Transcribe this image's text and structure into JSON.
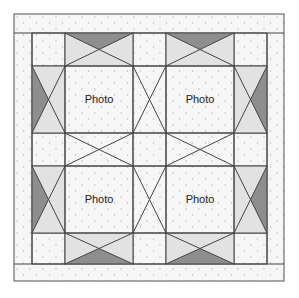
{
  "quilt": {
    "colors": {
      "background": "#ffffff",
      "border_fill": "#f6f6f6",
      "border_dot": "#b8b8b8",
      "corner_fill": "#ececec",
      "corner_squiggle": "#d2d2d2",
      "light_triangle": "#e2e2e2",
      "dark_triangle": "#8e8e8e",
      "photo_fill": "#ffffff",
      "outline": "#444444"
    },
    "photos": [
      {
        "label": "Photo",
        "position": "top-left"
      },
      {
        "label": "Photo",
        "position": "top-right"
      },
      {
        "label": "Photo",
        "position": "bottom-left"
      },
      {
        "label": "Photo",
        "position": "bottom-right"
      }
    ],
    "grid": {
      "outer": {
        "x0": 14,
        "y0": 14,
        "x1": 284,
        "y1": 281
      },
      "cols": [
        32,
        65,
        133,
        166,
        234,
        267
      ],
      "rows": [
        33,
        66,
        133,
        166,
        233,
        264
      ]
    }
  }
}
